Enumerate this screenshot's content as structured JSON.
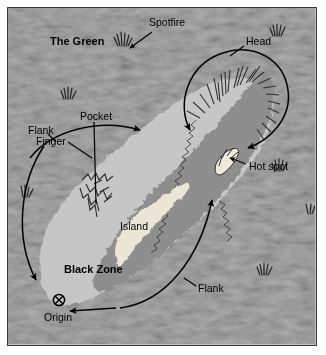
{
  "figure": {
    "type": "annotated-diagram"
  },
  "colors": {
    "background_green": "#bdbdbd",
    "fire_body": "#8c8c8c",
    "black_zone": "#c3c3c3",
    "island": "#ece7d8",
    "border": "#3a3a3a",
    "annotation": "#000000",
    "page": "#ffffff"
  },
  "labels": {
    "the_green": "The Green",
    "spotfire": "Spotfire",
    "head": "Head",
    "flank_left": "Flank",
    "pocket": "Pocket",
    "finger": "Finger",
    "hot_spot": "Hot spot",
    "island": "Island",
    "black_zone": "Black Zone",
    "flank_right": "Flank",
    "origin": "Origin"
  },
  "symbols": {
    "origin_marker": "crossed-circle-icon",
    "grass_tuft": "grass-tuft-icon"
  },
  "annotation_elements": [
    {
      "name": "head-loop",
      "kind": "encircling-arrow",
      "label": "Head"
    },
    {
      "name": "left-flank-arrow",
      "kind": "curved-arrow",
      "label": "Flank"
    },
    {
      "name": "right-flank-arrow",
      "kind": "curved-arrow",
      "label": "Flank"
    },
    {
      "name": "upper-spread-arrow",
      "kind": "curved-arrow",
      "label": ""
    },
    {
      "name": "origin-arrow",
      "kind": "straight-arrow",
      "label": "Origin"
    },
    {
      "name": "pocket-leader",
      "kind": "leader-line",
      "label": "Pocket"
    },
    {
      "name": "finger-leader",
      "kind": "leader-line",
      "label": "Finger"
    },
    {
      "name": "hot-spot-leader",
      "kind": "leader-line",
      "label": "Hot spot"
    },
    {
      "name": "spotfire-leader",
      "kind": "leader-line",
      "label": "Spotfire"
    }
  ]
}
